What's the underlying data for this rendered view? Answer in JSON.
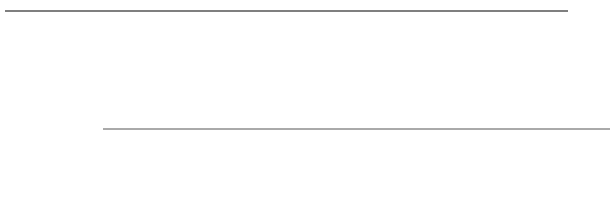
{
  "figure": {
    "type": "fsk-waveform-diagram",
    "background_color": "#ffffff",
    "stroke_color": "#3c3c3c",
    "axis_color": "#555555",
    "label_color": "#3a3a3a",
    "top_rule": {
      "x1": 5,
      "x2": 568,
      "y": 11,
      "thickness": 1.6
    },
    "zero_line": {
      "x1": 103,
      "x2": 610,
      "y": 129,
      "thickness": 1.0
    },
    "waveform": {
      "x_start": 48,
      "x_end": 580,
      "center_y": 129,
      "amplitude": 79,
      "start_phase_value": 122,
      "stroke_width": 1.3
    },
    "bit_labels": [
      {
        "text": "0",
        "x": 76,
        "y": 18
      },
      {
        "text": "0",
        "x": 158,
        "y": 18
      },
      {
        "text": "1",
        "x": 220,
        "y": 18
      },
      {
        "text": "1",
        "x": 261,
        "y": 18
      },
      {
        "text": "0",
        "x": 315,
        "y": 18
      },
      {
        "text": "0",
        "x": 388,
        "y": 18
      },
      {
        "text": "1",
        "x": 458,
        "y": 18
      },
      {
        "text": "1",
        "x": 494,
        "y": 18
      },
      {
        "text": "1",
        "x": 530,
        "y": 18
      },
      {
        "text": "1",
        "x": 566,
        "y": 18
      }
    ],
    "ghost_header": "scanned artifact row"
  },
  "chart_data": {
    "type": "line",
    "title": "",
    "subtitle": "",
    "xlabel": "",
    "ylabel": "",
    "grid": false,
    "legend": null,
    "modulation": "FSK",
    "bit_sequence": [
      0,
      0,
      1,
      1,
      0,
      0,
      1,
      1,
      1,
      1
    ],
    "bit_tick_labels": [
      "0",
      "0",
      "1",
      "1",
      "0",
      "0",
      "1",
      "1",
      "1",
      "1"
    ],
    "bit_boundaries_px": [
      48,
      111,
      186,
      204,
      241,
      278,
      328,
      371,
      443,
      480,
      516,
      553,
      580
    ],
    "segments": [
      {
        "bit": "0",
        "x_start": 48,
        "x_end": 186,
        "period_px": 85,
        "half_period_px": 42.5,
        "cycles": 1.6
      },
      {
        "bit": "0",
        "x_start": 186,
        "x_end": 204,
        "period_px": 85,
        "half_period_px": 42.5,
        "cycles": 0.2
      },
      {
        "bit": "1",
        "x_start": 204,
        "x_end": 241,
        "period_px": 37,
        "half_period_px": 18.5,
        "cycles": 1.0
      },
      {
        "bit": "1",
        "x_start": 241,
        "x_end": 278,
        "period_px": 37,
        "half_period_px": 18.5,
        "cycles": 1.0
      },
      {
        "bit": "0",
        "x_start": 278,
        "x_end": 366,
        "period_px": 85,
        "half_period_px": 42.5,
        "cycles": 1.0
      },
      {
        "bit": "0",
        "x_start": 366,
        "x_end": 443,
        "period_px": 85,
        "half_period_px": 42.5,
        "cycles": 0.9
      },
      {
        "bit": "1",
        "x_start": 443,
        "x_end": 480,
        "period_px": 37,
        "half_period_px": 18.5,
        "cycles": 1.0
      },
      {
        "bit": "1",
        "x_start": 480,
        "x_end": 516,
        "period_px": 37,
        "half_period_px": 18.5,
        "cycles": 1.0
      },
      {
        "bit": "1",
        "x_start": 516,
        "x_end": 553,
        "period_px": 37,
        "half_period_px": 18.5,
        "cycles": 1.0
      },
      {
        "bit": "1",
        "x_start": 553,
        "x_end": 580,
        "period_px": 37,
        "half_period_px": 18.5,
        "cycles": 0.75
      }
    ],
    "zero_crossings_px": [
      66,
      111,
      153,
      186,
      204,
      223,
      241,
      260,
      278,
      281,
      323,
      366,
      371,
      408,
      443,
      461,
      480,
      498,
      516,
      535,
      553,
      571
    ],
    "peaks_px": [
      {
        "x": 73,
        "y": 50
      },
      {
        "x": 173,
        "y": 51
      },
      {
        "x": 220,
        "y": 50
      },
      {
        "x": 258,
        "y": 50
      },
      {
        "x": 303,
        "y": 49
      },
      {
        "x": 389,
        "y": 49
      },
      {
        "x": 458,
        "y": 50
      },
      {
        "x": 494,
        "y": 50
      },
      {
        "x": 530,
        "y": 50
      },
      {
        "x": 566,
        "y": 50
      }
    ],
    "troughs_px": [
      {
        "x": 120,
        "y": 208
      },
      {
        "x": 196,
        "y": 208
      },
      {
        "x": 239,
        "y": 208
      },
      {
        "x": 350,
        "y": 208
      },
      {
        "x": 428,
        "y": 208
      },
      {
        "x": 476,
        "y": 208
      },
      {
        "x": 512,
        "y": 208
      },
      {
        "x": 548,
        "y": 208
      },
      {
        "x": 578,
        "y": 208
      }
    ],
    "ylim": [
      50,
      208
    ],
    "xlim": [
      48,
      580
    ],
    "amplitude_constant": true
  }
}
